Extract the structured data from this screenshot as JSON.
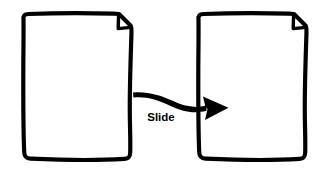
{
  "diagram": {
    "type": "flow-sketch",
    "background_color": "#ffffff",
    "stroke_color": "#000000",
    "fill_color": "#ffffff",
    "canvas": {
      "width": 326,
      "height": 174
    },
    "nodes": [
      {
        "id": "source-document",
        "shape": "page-with-folded-corner",
        "label": "",
        "fold_corner": "top-right",
        "x": 21,
        "y": 14,
        "width": 110,
        "height": 146
      },
      {
        "id": "target-document",
        "shape": "page-with-folded-corner",
        "label": "",
        "fold_corner": "top-right",
        "x": 196,
        "y": 14,
        "width": 110,
        "height": 146
      }
    ],
    "edges": [
      {
        "id": "slide-transition",
        "from": "source-document",
        "to": "target-document",
        "label": "Slide",
        "label_x": 161,
        "label_y": 118,
        "arrowhead": "solid-triangle",
        "style": "hand-drawn-curve"
      }
    ]
  }
}
